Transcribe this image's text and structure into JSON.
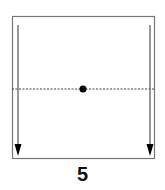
{
  "diagram": {
    "type": "fold-instruction",
    "step_number": "5",
    "square": {
      "x": 12,
      "y": 16,
      "width": 143,
      "height": 143,
      "stroke": "#777777"
    },
    "fold_line": {
      "style": "dotted",
      "y": 89,
      "color": "#444444"
    },
    "center_dot": {
      "x": 83,
      "y": 89,
      "r": 3.5,
      "color": "#000000"
    },
    "arrows": [
      {
        "name": "left-arrow",
        "x": 18,
        "y1": 25,
        "y2": 155,
        "direction": "down"
      },
      {
        "name": "right-arrow",
        "x": 150,
        "y1": 25,
        "y2": 155,
        "direction": "down"
      }
    ]
  }
}
